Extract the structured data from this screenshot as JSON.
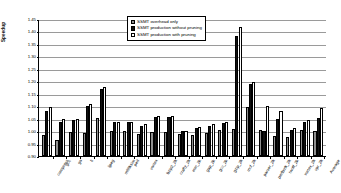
{
  "chart_data": {
    "type": "bar",
    "title": "",
    "xlabel": "",
    "ylabel": "Speedup",
    "ylim": [
      0.9,
      1.45
    ],
    "ytick_step": 0.05,
    "grid": true,
    "legend_position": "top-center",
    "yticks": [
      "0.90",
      "0.95",
      "1.00",
      "1.05",
      "1.10",
      "1.15",
      "1.20",
      "1.25",
      "1.30",
      "1.35",
      "1.40",
      "1.45"
    ],
    "categories": [
      "compress",
      "gcc",
      "go",
      "li",
      "ijpeg",
      "m88ksim",
      "perl",
      "vortex",
      "bzip2_2k",
      "crafty_2k",
      "eon_2k",
      "gap_2k",
      "gcc_2k",
      "gzip_2k",
      "mcf_2k",
      "parser_2k",
      "perlbmk_2k",
      "twolf_2k",
      "vortex_2k",
      "vpr_2k",
      "Average"
    ],
    "series": [
      {
        "name": "SSMT overhead only",
        "color": "#8f8f8f",
        "values": [
          0.985,
          0.963,
          0.995,
          0.993,
          1.051,
          1.001,
          1.0,
          0.988,
          0.996,
          0.995,
          0.987,
          0.986,
          0.992,
          1.003,
          1.007,
          1.095,
          1.003,
          0.982,
          0.978,
          1.003,
          1.002
        ]
      },
      {
        "name": "SSMT production without pruning",
        "color": "#111111",
        "values": [
          1.082,
          1.035,
          1.046,
          1.102,
          1.17,
          1.035,
          1.035,
          1.019,
          1.056,
          1.056,
          1.0,
          1.014,
          1.022,
          1.031,
          1.38,
          1.19,
          1.0,
          1.05,
          1.006,
          1.036,
          1.052
        ]
      },
      {
        "name": "SSMT production with pruning",
        "color": "#ffffff",
        "values": [
          1.096,
          1.05,
          1.05,
          1.11,
          1.178,
          1.035,
          1.035,
          1.03,
          1.06,
          1.06,
          1.002,
          1.018,
          1.028,
          1.035,
          1.418,
          1.196,
          1.1,
          1.08,
          1.012,
          1.043,
          1.092
        ]
      }
    ]
  },
  "legend": {
    "items": [
      {
        "label": "SSMT overhead only",
        "swatch": "gray"
      },
      {
        "label": "SSMT production without pruning",
        "swatch": "black"
      },
      {
        "label": "SSMT production with pruning",
        "swatch": "white"
      }
    ]
  }
}
